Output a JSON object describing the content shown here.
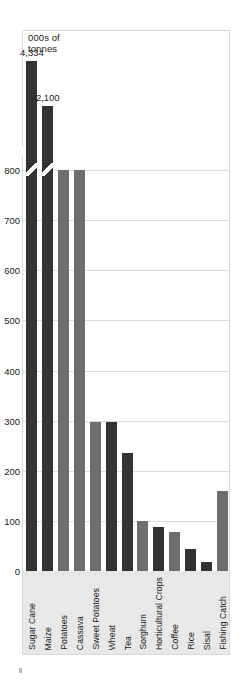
{
  "chart_data": {
    "type": "bar",
    "title": "",
    "axis_title": "000s of\ntonnes",
    "xlabel": "",
    "ylabel": "000s of tonnes",
    "ylim": [
      0,
      800
    ],
    "yticks": [
      0,
      100,
      200,
      300,
      400,
      500,
      600,
      700,
      800
    ],
    "grid": true,
    "legend": "none",
    "axis_break": {
      "present": true,
      "note": "Y axis broken above 800; Sugar Cane and Maize bars truncated with diagonal break marks",
      "broken_bars": [
        "Sugar Cane",
        "Maize"
      ]
    },
    "categories": [
      "Sugar Cane",
      "Maize",
      "Potatoes",
      "Cassava",
      "Sweet Potatoes",
      "Wheat",
      "Tea",
      "Sorghum",
      "Horticultural Crops",
      "Coffee",
      "Rice",
      "Sisal",
      "Fishing Catch"
    ],
    "values": [
      4334,
      2100,
      800,
      800,
      297,
      297,
      235,
      100,
      88,
      78,
      43,
      18,
      160
    ],
    "data_labels": {
      "Sugar Cane": "4,334",
      "Maize": "2,100"
    },
    "colors": {
      "dark_bar": "#333333",
      "gray_bar": "#6e6e6e",
      "plot_background": "#ffffff",
      "gridline": "#dcdcdc",
      "label_band": "#e8e8e8",
      "border": "#d9d9d9"
    },
    "bars": [
      {
        "label": "Sugar Cane",
        "value": 4334,
        "display_height_units": 960,
        "shade": "dark",
        "broken": true,
        "data_label": "4,334"
      },
      {
        "label": "Maize",
        "value": 2100,
        "display_height_units": 905,
        "shade": "dark",
        "broken": true,
        "data_label": "2,100"
      },
      {
        "label": "Potatoes",
        "value": 800,
        "display_height_units": 800,
        "shade": "gray",
        "broken": false,
        "data_label": ""
      },
      {
        "label": "Cassava",
        "value": 800,
        "display_height_units": 800,
        "shade": "gray",
        "broken": false,
        "data_label": ""
      },
      {
        "label": "Sweet Potatoes",
        "value": 297,
        "display_height_units": 297,
        "shade": "gray",
        "broken": false,
        "data_label": ""
      },
      {
        "label": "Wheat",
        "value": 297,
        "display_height_units": 297,
        "shade": "dark",
        "broken": false,
        "data_label": ""
      },
      {
        "label": "Tea",
        "value": 235,
        "display_height_units": 235,
        "shade": "dark",
        "broken": false,
        "data_label": ""
      },
      {
        "label": "Sorghum",
        "value": 100,
        "display_height_units": 100,
        "shade": "gray",
        "broken": false,
        "data_label": ""
      },
      {
        "label": "Horticultural Crops",
        "value": 88,
        "display_height_units": 88,
        "shade": "dark",
        "broken": false,
        "data_label": ""
      },
      {
        "label": "Coffee",
        "value": 78,
        "display_height_units": 78,
        "shade": "gray",
        "broken": false,
        "data_label": ""
      },
      {
        "label": "Rice",
        "value": 43,
        "display_height_units": 43,
        "shade": "dark",
        "broken": false,
        "data_label": ""
      },
      {
        "label": "Sisal",
        "value": 18,
        "display_height_units": 18,
        "shade": "dark",
        "broken": false,
        "data_label": ""
      },
      {
        "label": "Fishing Catch",
        "value": 160,
        "display_height_units": 160,
        "shade": "gray",
        "broken": false,
        "data_label": ""
      }
    ]
  }
}
